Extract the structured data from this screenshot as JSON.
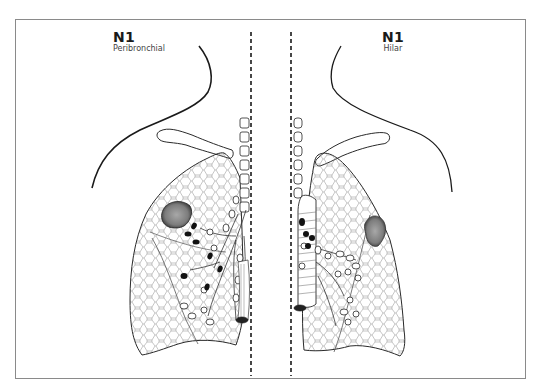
{
  "figure": {
    "left_panel": {
      "stage": "N1",
      "subtitle": "Peribronchial"
    },
    "right_panel": {
      "stage": "N1",
      "subtitle": "Hilar"
    },
    "colors": {
      "frame": "#8a8a8a",
      "line": "#1a1a1a",
      "tumor": "#7a7a7a",
      "lymph_node_involved": "#111111",
      "lung_texture": "#9a9a9a"
    }
  }
}
